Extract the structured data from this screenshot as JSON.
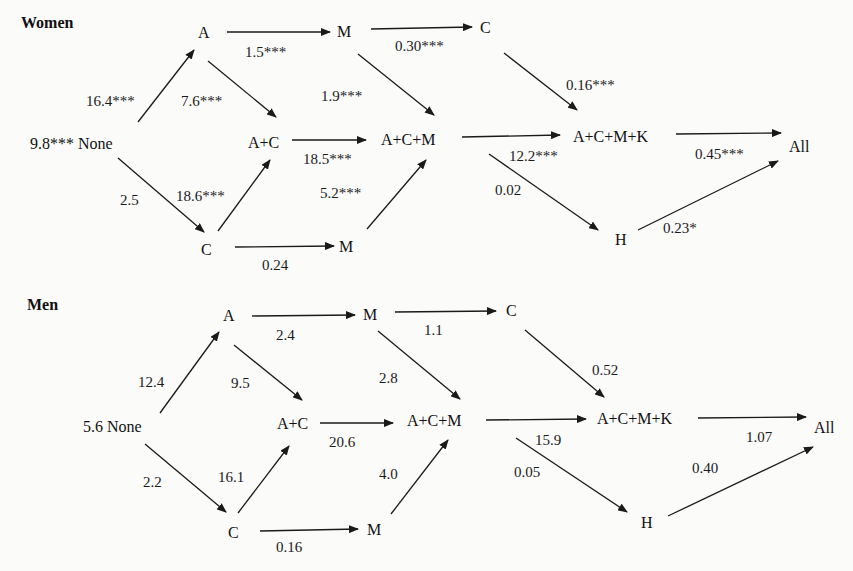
{
  "panels": {
    "women": {
      "title": "Women",
      "nodes": {
        "none": "9.8*** None",
        "a": "A",
        "c": "C",
        "ac": "A+C",
        "m_top": "M",
        "c_top": "C",
        "m_bottom": "M",
        "acm": "A+C+M",
        "acmk": "A+C+M+K",
        "h": "H",
        "all": "All"
      },
      "edges": {
        "none_a": "16.4***",
        "none_c": "2.5",
        "a_m": "1.5***",
        "a_ac": "7.6***",
        "c_ac": "18.6***",
        "c_m": "0.24",
        "m_c": "0.30***",
        "m_acm": "1.9***",
        "ac_acm": "18.5***",
        "m_acm_bottom": "5.2***",
        "c_acmk": "0.16***",
        "acm_acmk": "12.2***",
        "acm_h": "0.02",
        "acmk_all": "0.45***",
        "h_all": "0.23*"
      }
    },
    "men": {
      "title": "Men",
      "nodes": {
        "none": "5.6 None",
        "a": "A",
        "c": "C",
        "ac": "A+C",
        "m_top": "M",
        "c_top": "C",
        "m_bottom": "M",
        "acm": "A+C+M",
        "acmk": "A+C+M+K",
        "h": "H",
        "all": "All"
      },
      "edges": {
        "none_a": "12.4",
        "none_c": "2.2",
        "a_m": "2.4",
        "a_ac": "9.5",
        "c_ac": "16.1",
        "c_m": "0.16",
        "m_c": "1.1",
        "m_acm": "2.8",
        "ac_acm": "20.6",
        "m_acm_bottom": "4.0",
        "c_acmk": "0.52",
        "acm_acmk": "15.9",
        "acm_h": "0.05",
        "acmk_all": "1.07",
        "h_all": "0.40"
      }
    }
  },
  "colors": {
    "ink": "#1a1a1a",
    "background": "#fbfbfa"
  }
}
